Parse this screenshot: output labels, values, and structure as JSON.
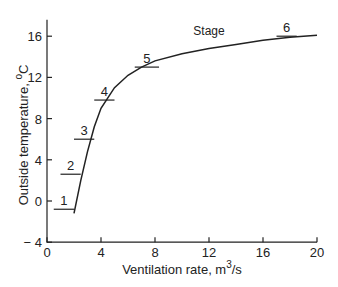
{
  "chart_data": {
    "type": "line",
    "title": "",
    "xlabel": "Ventilation rate, m³/s",
    "ylabel": "Outside temperature, °C",
    "xlim": [
      0,
      20
    ],
    "ylim": [
      -4,
      18
    ],
    "xticks": [
      0,
      4,
      8,
      12,
      16,
      20
    ],
    "yticks": [
      -4,
      0,
      4,
      8,
      12,
      16
    ],
    "grid": false,
    "series": [
      {
        "name": "Stage curve",
        "x": [
          2.0,
          2.5,
          3.0,
          3.5,
          4.0,
          5.0,
          6.0,
          7.0,
          8.0,
          10.0,
          12.0,
          14.0,
          16.0,
          18.0,
          20.0
        ],
        "y": [
          -1.2,
          2.0,
          4.8,
          7.2,
          9.0,
          11.0,
          12.2,
          13.0,
          13.6,
          14.3,
          14.8,
          15.2,
          15.6,
          15.9,
          16.1
        ]
      }
    ],
    "annotations": [
      {
        "label": "1",
        "x0": 0.5,
        "x1": 2.0,
        "y": -0.8
      },
      {
        "label": "2",
        "x0": 1.0,
        "x1": 2.5,
        "y": 2.6
      },
      {
        "label": "3",
        "x0": 2.0,
        "x1": 3.5,
        "y": 6.0
      },
      {
        "label": "4",
        "x0": 3.5,
        "x1": 5.0,
        "y": 9.8
      },
      {
        "label": "5",
        "x0": 6.5,
        "x1": 8.3,
        "y": 13.0
      },
      {
        "label": "6",
        "x0": 17.0,
        "x1": 18.5,
        "y": 16.0
      },
      {
        "label": "Stage",
        "x": 12.0,
        "y": 15.6
      }
    ]
  }
}
